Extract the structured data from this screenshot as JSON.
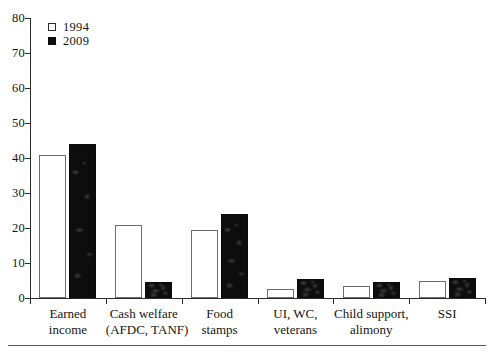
{
  "chart_data": {
    "type": "bar",
    "title": "",
    "xlabel": "",
    "ylabel": "",
    "ylim": [
      0,
      80
    ],
    "ytick_values": [
      0,
      10,
      20,
      30,
      40,
      50,
      60,
      70,
      80
    ],
    "ytick_labels": [
      "0",
      "10",
      "20",
      "30",
      "40",
      "50",
      "60",
      "70",
      "80"
    ],
    "grid": false,
    "legend_position": "top-left",
    "categories": [
      "Earned income",
      "Cash welfare (AFDC, TANF)",
      "Food stamps",
      "UI, WC, veterans",
      "Child support, alimony",
      "SSI"
    ],
    "category_lines": [
      [
        "Earned",
        "income"
      ],
      [
        "Cash welfare",
        "(AFDC, TANF)"
      ],
      [
        "Food",
        "stamps"
      ],
      [
        "UI, WC,",
        "veterans"
      ],
      [
        "Child support,",
        "alimony"
      ],
      [
        "SSI"
      ]
    ],
    "series": [
      {
        "name": "1994",
        "color": "#ffffff",
        "values": [
          41,
          21,
          19.5,
          2.5,
          3.3,
          5
        ]
      },
      {
        "name": "2009",
        "color": "#0d0d0d",
        "values": [
          44,
          4.5,
          24,
          5.5,
          4.5,
          5.7
        ]
      }
    ]
  },
  "legend": {
    "items": [
      {
        "label": "1994",
        "swatch": "open-square-icon"
      },
      {
        "label": "2009",
        "swatch": "filled-square-icon"
      }
    ]
  }
}
